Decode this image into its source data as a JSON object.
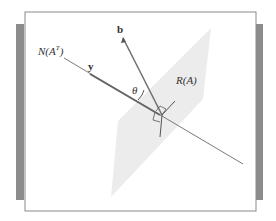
{
  "figure": {
    "type": "geometric-diagram",
    "labels": {
      "null_space": "N(A",
      "null_space_sup": "T",
      "null_space_close": ")",
      "y_vector": "y",
      "b_vector": "b",
      "range": "R(A)",
      "theta": "θ"
    },
    "colors": {
      "background": "#ffffff",
      "frame": "#888888",
      "side_bars": "#8c8c8c",
      "plane_fill": "#ececec",
      "line": "#6e6e6e",
      "text": "#333333"
    }
  }
}
